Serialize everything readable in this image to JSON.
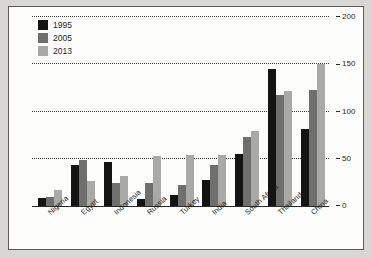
{
  "chart_data": {
    "type": "bar",
    "title": "",
    "subtitle": "",
    "xlabel": "",
    "ylabel": "",
    "ylim": [
      0,
      200
    ],
    "yticks": [
      0,
      50,
      100,
      150,
      200
    ],
    "ytick_labels": [
      "0",
      "50",
      "100",
      "150",
      "200"
    ],
    "grid": true,
    "grid_style": "dotted-horizontal",
    "legend_position": "top-left",
    "categories": [
      "Nigeria",
      "Egypt",
      "Indonesia",
      "Russia",
      "Turkey",
      "India",
      "South Africa",
      "Thailand",
      "China"
    ],
    "series": [
      {
        "name": "1995",
        "color": "#141414",
        "values": [
          9,
          43,
          47,
          7,
          12,
          28,
          55,
          145,
          82
        ]
      },
      {
        "name": "2005",
        "color": "#6f6f6d",
        "values": [
          10,
          49,
          24,
          24,
          22,
          43,
          73,
          118,
          123
        ]
      },
      {
        "name": "2013",
        "color": "#a9a9a6",
        "values": [
          17,
          26,
          32,
          53,
          54,
          54,
          79,
          122,
          150
        ]
      }
    ]
  },
  "legend": {
    "items": [
      {
        "label": "1995"
      },
      {
        "label": "2005"
      },
      {
        "label": "2013"
      }
    ]
  }
}
